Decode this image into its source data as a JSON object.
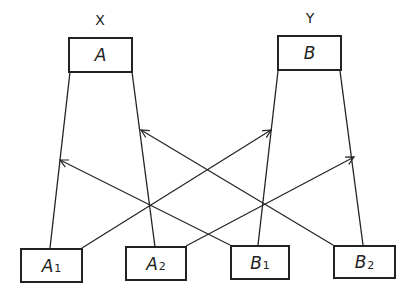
{
  "diagram": {
    "groups": [
      {
        "label": "X",
        "box": {
          "main": "A",
          "sub": ""
        }
      },
      {
        "label": "Y",
        "box": {
          "main": "B",
          "sub": ""
        }
      }
    ],
    "bottom_boxes": [
      {
        "main": "A",
        "sub": "1"
      },
      {
        "main": "A",
        "sub": "2"
      },
      {
        "main": "B",
        "sub": "1"
      },
      {
        "main": "B",
        "sub": "2"
      }
    ],
    "connections": [
      {
        "from": "A",
        "to": "A1",
        "type": "line"
      },
      {
        "from": "A",
        "to": "A2",
        "type": "line"
      },
      {
        "from": "B",
        "to": "B1",
        "type": "line"
      },
      {
        "from": "B",
        "to": "B2",
        "type": "line"
      },
      {
        "from": "A1",
        "to": "B-A1... line (Y left edge)",
        "type": "arrow"
      },
      {
        "from": "A2",
        "to": "Y right edge",
        "type": "arrow"
      },
      {
        "from": "B1",
        "to": "X left edge",
        "type": "arrow"
      },
      {
        "from": "B2",
        "to": "X right edge",
        "type": "arrow"
      }
    ],
    "line_color": "#222222"
  }
}
